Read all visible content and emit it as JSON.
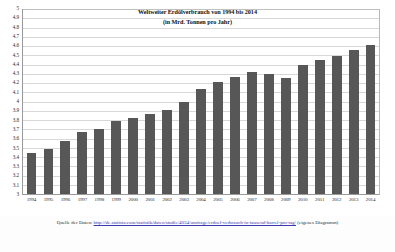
{
  "chart_data": {
    "type": "bar",
    "title": "Weltweiter Erdölverbrauch von 1994 bis 2014",
    "subtitle": "(in Mrd. Tonnen pro Jahr)",
    "xlabel": "",
    "ylabel": "",
    "ylim": [
      3,
      5
    ],
    "ytick_step": 0.1,
    "grid": true,
    "legend": "none",
    "bar_color": "#575757",
    "categories": [
      "1994",
      "1995",
      "1996",
      "1997",
      "1998",
      "1999",
      "2000",
      "2001",
      "2002",
      "2003",
      "2004",
      "2005",
      "2006",
      "2007",
      "2008",
      "2009",
      "2010",
      "2011",
      "2012",
      "2013",
      "2014"
    ],
    "values": [
      3.44,
      3.49,
      3.57,
      3.67,
      3.7,
      3.79,
      3.82,
      3.86,
      3.91,
      4.0,
      4.14,
      4.21,
      4.26,
      4.32,
      4.3,
      4.25,
      4.39,
      4.45,
      4.49,
      4.56,
      4.61
    ],
    "ytick_labels": [
      "5",
      "4.9",
      "4.8",
      "4.7",
      "4.6",
      "4.5",
      "4.4",
      "4.3",
      "4.2",
      "4.1",
      "4",
      "3.9",
      "3.8",
      "3.7",
      "3.6",
      "3.5",
      "3.4",
      "3.3",
      "3.2",
      "3.1",
      "3"
    ]
  },
  "caption": {
    "label": "Quelle der Daten:",
    "url": "http://de.statista.com/statistik/daten/studie/4034/umfrage/erdoel-verbrauch-in-tausend-barrel-pro-tag/",
    "note": "(eigenes Diagramm)"
  }
}
